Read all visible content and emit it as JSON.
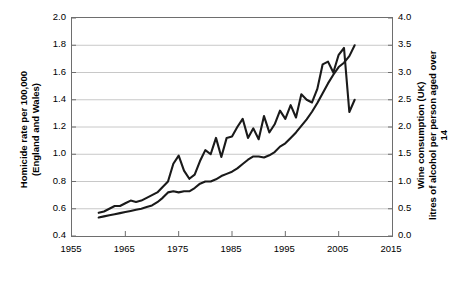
{
  "chart_data": {
    "type": "line",
    "title": "",
    "subtitle": "",
    "xlabel": "",
    "ylabel": "Homicide rate per 100,000\n(England and Wales)",
    "y2label": "Wine consumption (UK)\nlitres of alcohol per person aged over 14",
    "xlim": [
      1955,
      2015
    ],
    "ylim": [
      0.4,
      2.0
    ],
    "y2lim": [
      0.0,
      4.0
    ],
    "grid": "horizontal",
    "legend": "none",
    "xticks": [
      "1955",
      "1965",
      "1975",
      "1985",
      "1995",
      "2005",
      "2015"
    ],
    "xtick_values": [
      1955,
      1965,
      1975,
      1985,
      1995,
      2005,
      2015
    ],
    "yticks": [
      "0.4",
      "0.6",
      "0.8",
      "1.0",
      "1.2",
      "1.4",
      "1.6",
      "1.8",
      "2.0"
    ],
    "ytick_values": [
      0.4,
      0.6,
      0.8,
      1.0,
      1.2,
      1.4,
      1.6,
      1.8,
      2.0
    ],
    "y2ticks": [
      "0.0",
      "0.5",
      "1.0",
      "1.5",
      "2.0",
      "2.5",
      "3.0",
      "3.5",
      "4.0"
    ],
    "y2tick_values": [
      0.0,
      0.5,
      1.0,
      1.5,
      2.0,
      2.5,
      3.0,
      3.5,
      4.0
    ],
    "line_color": "#1a1a1a",
    "grid_color": "#c8c8c8",
    "axis_color": "#6e6e6e",
    "series": [
      {
        "name": "Homicide rate per 100,000 (England and Wales)",
        "axis": "left",
        "x": [
          1960,
          1961,
          1962,
          1963,
          1964,
          1965,
          1966,
          1967,
          1968,
          1969,
          1970,
          1971,
          1972,
          1973,
          1974,
          1975,
          1976,
          1977,
          1978,
          1979,
          1980,
          1981,
          1982,
          1983,
          1984,
          1985,
          1986,
          1987,
          1988,
          1989,
          1990,
          1991,
          1992,
          1993,
          1994,
          1995,
          1996,
          1997,
          1998,
          1999,
          2000,
          2001,
          2002,
          2003,
          2004,
          2005,
          2006,
          2007,
          2008
        ],
        "values": [
          0.57,
          0.58,
          0.6,
          0.62,
          0.62,
          0.64,
          0.66,
          0.65,
          0.66,
          0.68,
          0.7,
          0.72,
          0.76,
          0.8,
          0.93,
          0.99,
          0.88,
          0.82,
          0.85,
          0.95,
          1.03,
          1.0,
          1.12,
          0.98,
          1.12,
          1.13,
          1.2,
          1.26,
          1.12,
          1.19,
          1.11,
          1.28,
          1.16,
          1.22,
          1.32,
          1.26,
          1.36,
          1.27,
          1.44,
          1.4,
          1.38,
          1.48,
          1.66,
          1.68,
          1.6,
          1.73,
          1.78,
          1.31,
          1.4
        ]
      },
      {
        "name": "Wine consumption (UK) litres of alcohol per person aged over 14",
        "axis": "right",
        "x": [
          1960,
          1961,
          1962,
          1963,
          1964,
          1965,
          1966,
          1967,
          1968,
          1969,
          1970,
          1971,
          1972,
          1973,
          1974,
          1975,
          1976,
          1977,
          1978,
          1979,
          1980,
          1981,
          1982,
          1983,
          1984,
          1985,
          1986,
          1987,
          1988,
          1989,
          1990,
          1991,
          1992,
          1993,
          1994,
          1995,
          1996,
          1997,
          1998,
          1999,
          2000,
          2001,
          2002,
          2003,
          2004,
          2005,
          2006,
          2007,
          2008
        ],
        "values": [
          0.34,
          0.36,
          0.38,
          0.4,
          0.42,
          0.44,
          0.46,
          0.48,
          0.5,
          0.53,
          0.56,
          0.62,
          0.7,
          0.8,
          0.82,
          0.8,
          0.82,
          0.82,
          0.88,
          0.96,
          1.0,
          1.0,
          1.04,
          1.1,
          1.14,
          1.18,
          1.24,
          1.32,
          1.4,
          1.46,
          1.46,
          1.44,
          1.48,
          1.54,
          1.64,
          1.7,
          1.8,
          1.9,
          2.02,
          2.14,
          2.28,
          2.44,
          2.62,
          2.8,
          2.96,
          3.1,
          3.18,
          3.3,
          3.5
        ]
      }
    ]
  }
}
